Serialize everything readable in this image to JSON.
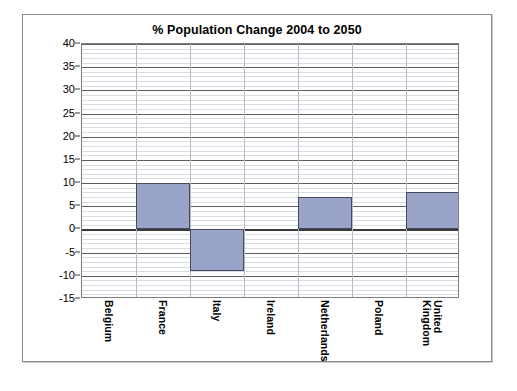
{
  "chart_data": {
    "type": "bar",
    "title": "% Population Change 2004 to 2050",
    "xlabel": "",
    "ylabel": "",
    "categories": [
      "Belgium",
      "France",
      "Italy",
      "Ireland",
      "Netherlands",
      "Poland",
      "United Kingdom"
    ],
    "values": [
      0,
      10,
      -9,
      0,
      7,
      0,
      8
    ],
    "ylim": [
      -15,
      40
    ],
    "ytick_labels": [
      "40",
      "35",
      "30",
      "25",
      "20",
      "15",
      "10",
      "5",
      "0",
      "-5",
      "-10",
      "-15"
    ],
    "ytick_values": [
      40,
      35,
      30,
      25,
      20,
      15,
      10,
      5,
      0,
      -5,
      -10,
      -15
    ],
    "major_tick_step": 5,
    "minor_tick_step": 1,
    "grid": "horizontal major and minor, vertical category separators",
    "legend": "none",
    "series": [
      {
        "name": "% Population Change 2004 to 2050",
        "values": [
          0,
          10,
          -9,
          0,
          7,
          0,
          8
        ]
      }
    ]
  },
  "colors": {
    "bar_fill": "#9aa3c8",
    "bar_border": "#4a4a5e",
    "grid_major": "#5e5e5e",
    "grid_minor": "#d7dde4",
    "axis": "#3a3a3a",
    "frame": "#8a8a8a",
    "background": "#ffffff",
    "text": "#000000"
  }
}
